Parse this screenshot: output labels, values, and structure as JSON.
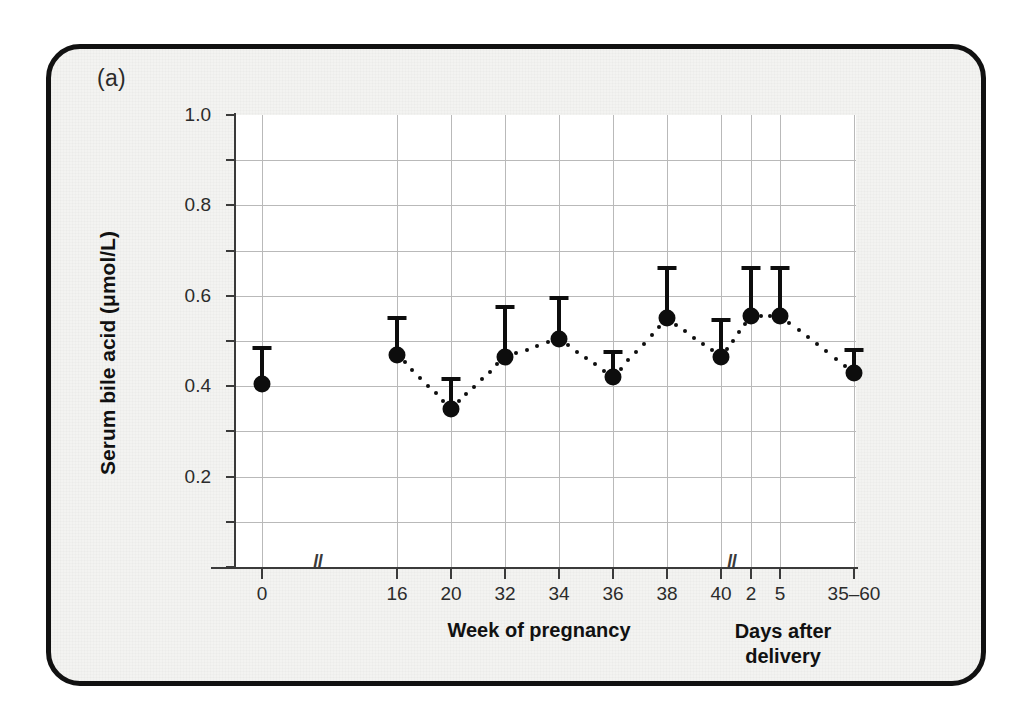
{
  "figure": {
    "panel_label": "(a)"
  },
  "chart_data": {
    "type": "scatter",
    "title": "",
    "ylabel": "Serum bile acid (μmol/L)",
    "xlabel_primary": "Week of pregnancy",
    "xlabel_secondary_line1": "Days after",
    "xlabel_secondary_line2": "delivery",
    "ylim": [
      0.0,
      1.0
    ],
    "ytick_labels": [
      "0.2",
      "0.4",
      "0.6",
      "0.8",
      "1.0"
    ],
    "ytick_values": [
      0.2,
      0.4,
      0.6,
      0.8,
      1.0
    ],
    "yminor_values": [
      0.1,
      0.3,
      0.5,
      0.7,
      0.9
    ],
    "grid": true,
    "legend": "none",
    "axis_breaks": [
      "after 0",
      "after 40"
    ],
    "categories": [
      "0",
      "16",
      "20",
      "32",
      "34",
      "36",
      "38",
      "40",
      "2",
      "5",
      "35–60"
    ],
    "values": [
      0.405,
      0.47,
      0.35,
      0.465,
      0.505,
      0.42,
      0.55,
      0.465,
      0.555,
      0.555,
      0.43
    ],
    "error_upper": [
      0.49,
      0.555,
      0.42,
      0.58,
      0.6,
      0.48,
      0.665,
      0.55,
      0.665,
      0.665,
      0.485
    ],
    "error_direction": "upper-only",
    "connector": "dotted",
    "marker": "filled-circle",
    "marker_color": "#0d0d0d",
    "grid_color": "#b9b9b9",
    "plot_background": "#ffffff",
    "card_background": "#f3f3f1",
    "card_border_color": "#111111"
  }
}
